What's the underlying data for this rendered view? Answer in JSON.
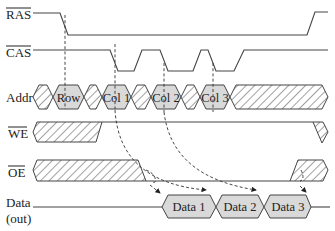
{
  "diagram": {
    "signals": [
      {
        "id": "ras",
        "label": "RAS",
        "overbar": true
      },
      {
        "id": "cas",
        "label": "CAS",
        "overbar": true
      },
      {
        "id": "addr",
        "label": "Addr",
        "overbar": false
      },
      {
        "id": "we",
        "label": "WE",
        "overbar": true
      },
      {
        "id": "oe",
        "label": "OE",
        "overbar": true
      },
      {
        "id": "data",
        "label": "Data",
        "sublabel": "(out)",
        "overbar": false
      }
    ],
    "addr_cells": [
      "Row",
      "Col 1",
      "Col 2",
      "Col 3"
    ],
    "data_cells": [
      "Data 1",
      "Data 2",
      "Data 3"
    ],
    "colors": {
      "line": "#444444",
      "cell_fill": "#d9d9d9",
      "background": "#ffffff",
      "text": "#222222"
    }
  }
}
